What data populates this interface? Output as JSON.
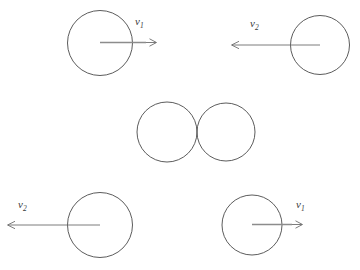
{
  "diagram": {
    "background_color": "#ffffff",
    "circle_stroke_color": "#4a4a4a",
    "arrow_color": "#8c8c8c",
    "label_color": "#3a3a3a",
    "stages": [
      {
        "id": "before-collision",
        "name": "before",
        "bodies": [
          {
            "id": "top-left-ball",
            "cx": 100,
            "cy": 43,
            "r": 32.5,
            "arrow": {
              "direction": "right",
              "from_x": 100,
              "to_x": 156,
              "y": 43,
              "label": "v",
              "subscript": "1",
              "label_x": 135,
              "label_y": 25
            }
          },
          {
            "id": "top-right-ball",
            "cx": 320,
            "cy": 45,
            "r": 29.5,
            "arrow": {
              "direction": "left",
              "from_x": 320,
              "to_x": 232,
              "y": 45,
              "label": "v",
              "subscript": "2",
              "label_x": 250,
              "label_y": 27
            }
          }
        ]
      },
      {
        "id": "at-contact",
        "name": "contact",
        "bodies": [
          {
            "id": "middle-left-ball",
            "cx": 167,
            "cy": 132,
            "r": 30,
            "arrow": null
          },
          {
            "id": "middle-right-ball",
            "cx": 226,
            "cy": 132,
            "r": 29,
            "arrow": null
          }
        ]
      },
      {
        "id": "after-collision",
        "name": "after",
        "bodies": [
          {
            "id": "bottom-left-ball",
            "cx": 100,
            "cy": 225,
            "r": 32.5,
            "arrow": {
              "direction": "left",
              "from_x": 100,
              "to_x": 8,
              "y": 225,
              "label": "v",
              "subscript": "2",
              "label_x": 18,
              "label_y": 208
            }
          },
          {
            "id": "bottom-right-ball",
            "cx": 252,
            "cy": 225,
            "r": 30,
            "arrow": {
              "direction": "right",
              "from_x": 252,
              "to_x": 302,
              "y": 225,
              "label": "v",
              "subscript": "1",
              "label_x": 296,
              "label_y": 208
            }
          }
        ]
      }
    ],
    "labels": {
      "v1": "v",
      "v1_sub": "1",
      "v2": "v",
      "v2_sub": "2"
    }
  }
}
